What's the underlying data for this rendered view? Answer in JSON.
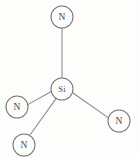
{
  "diagram": {
    "type": "molecular-structure",
    "canvas": {
      "width": 138,
      "height": 158,
      "background": "#fdfdfc"
    },
    "style": {
      "node_fill": "#fdfdfc",
      "node_stroke": "#75767a",
      "bond_stroke": "#8a8a8c",
      "label_color": "#4a4a4d",
      "stroke_width": 1.05,
      "node_radius": 11
    },
    "nodes": [
      {
        "id": "si-center",
        "label": "Si",
        "element": "Si",
        "role": "center",
        "cx": 62,
        "cy": 89,
        "r": 11
      },
      {
        "id": "n-top",
        "label": "N",
        "element": "N",
        "role": "ligand",
        "cx": 62,
        "cy": 17,
        "r": 11
      },
      {
        "id": "n-left",
        "label": "N",
        "element": "N",
        "role": "ligand",
        "cx": 17,
        "cy": 107,
        "r": 11
      },
      {
        "id": "n-bottom-left",
        "label": "N",
        "element": "N",
        "role": "ligand",
        "cx": 24,
        "cy": 145,
        "r": 11
      },
      {
        "id": "n-right",
        "label": "N",
        "element": "N",
        "role": "ligand",
        "cx": 119,
        "cy": 121,
        "r": 11
      }
    ],
    "bonds": [
      {
        "id": "bond-si-n-top",
        "from": "si-center",
        "to": "n-top",
        "order": 1,
        "x1": 62,
        "y1": 78,
        "x2": 62,
        "y2": 28
      },
      {
        "id": "bond-si-n-left",
        "from": "si-center",
        "to": "n-left",
        "order": 1,
        "x1": 51.3,
        "y1": 91.5,
        "x2": 27.8,
        "y2": 104.6
      },
      {
        "id": "bond-si-n-bottom-left",
        "from": "si-center",
        "to": "n-bottom-left",
        "order": 1,
        "x1": 56.2,
        "y1": 98.4,
        "x2": 29.6,
        "y2": 135.5
      },
      {
        "id": "bond-si-n-right",
        "from": "si-center",
        "to": "n-right",
        "order": 1,
        "x1": 72.3,
        "y1": 92.5,
        "x2": 108.2,
        "y2": 117.6
      }
    ]
  }
}
